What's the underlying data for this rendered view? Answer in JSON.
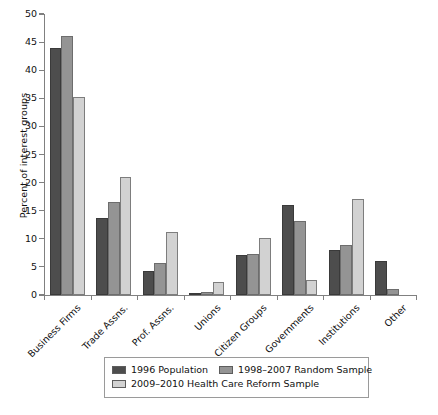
{
  "chart_data": {
    "type": "bar",
    "title": "",
    "xlabel": "",
    "ylabel": "Percent of interest groups",
    "ylim": [
      0,
      50
    ],
    "yticks": [
      0,
      5,
      10,
      15,
      20,
      25,
      30,
      35,
      40,
      45,
      50
    ],
    "grid": false,
    "legend_position": "bottom",
    "categories": [
      "Business Firms",
      "Trade Assns.",
      "Prof. Assns.",
      "Unions",
      "Citizen Groups",
      "Governments",
      "Institutions",
      "Other"
    ],
    "series": [
      {
        "name": "1996 Population",
        "color": "#4d4d4d",
        "values": [
          44.0,
          13.7,
          4.2,
          0.4,
          7.1,
          16.0,
          8.0,
          6.0
        ]
      },
      {
        "name": "1998–2007 Random Sample",
        "color": "#949494",
        "values": [
          46.0,
          16.5,
          5.7,
          0.5,
          7.3,
          13.2,
          8.9,
          1.0
        ]
      },
      {
        "name": "2009–2010 Health Care Reform Sample",
        "color": "#d2d2d2",
        "values": [
          35.3,
          21.0,
          11.2,
          2.3,
          10.1,
          2.7,
          17.0,
          0.0
        ]
      }
    ]
  },
  "legend": {
    "items": [
      {
        "label": "1996 Population",
        "swatch": "#4d4d4d"
      },
      {
        "label": "1998–2007 Random Sample",
        "swatch": "#949494"
      },
      {
        "label": "2009–2010 Health Care Reform Sample",
        "swatch": "#d2d2d2"
      }
    ]
  }
}
